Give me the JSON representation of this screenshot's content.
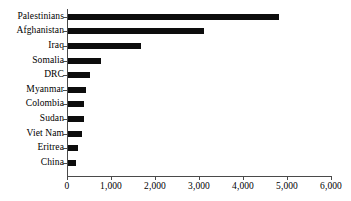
{
  "chart_data": {
    "type": "bar",
    "orientation": "horizontal",
    "title": "",
    "subtitle": "",
    "xlabel": "",
    "ylabel": "",
    "categories": [
      "Palestinians",
      "Afghanistan",
      "Iraq",
      "Somalia",
      "DRC",
      "Myanmar",
      "Colombia",
      "Sudan",
      "Viet Nam",
      "Eritrea",
      "China"
    ],
    "values": [
      4800,
      3090,
      1660,
      750,
      500,
      410,
      370,
      370,
      320,
      230,
      180
    ],
    "xlim": [
      0,
      6000
    ],
    "xticks": [
      0,
      1000,
      2000,
      3000,
      4000,
      5000,
      6000
    ],
    "xtick_labels": [
      "0",
      "1,000",
      "2,000",
      "3,000",
      "4,000",
      "5,000",
      "6,000"
    ],
    "grid": false,
    "legend": false,
    "bar_color": "#0d0d0d",
    "axis_color": "#4a4a4a"
  }
}
